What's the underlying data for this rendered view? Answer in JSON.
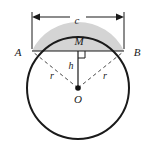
{
  "figure": {
    "name": "circular-segment-diagram",
    "type": "geometry-diagram",
    "background": "#ffffff",
    "stroke_color": "#1a1a1a",
    "segment_fill": "#d4d4d4",
    "dashed_color": "#555555"
  },
  "labels": {
    "chord_dimension": "c",
    "point_a": "A",
    "point_b": "B",
    "segment_area": "M",
    "height": "h",
    "radius_left": "r",
    "radius_right": "r",
    "center": "O"
  },
  "geometry": {
    "circle": {
      "cx": 78,
      "cy": 88,
      "r": 51
    },
    "chord": {
      "x1": 32,
      "y1": 51,
      "x2": 124,
      "y2": 51
    },
    "dimension_line": {
      "y": 17,
      "x1": 32,
      "x2": 124
    },
    "height_line": {
      "x": 78,
      "y1": 51,
      "y2": 88
    },
    "right_angle_marker": {
      "x": 78,
      "y": 51,
      "size": 7
    },
    "center_dot": {
      "cx": 78,
      "cy": 88,
      "r": 2.6
    }
  },
  "icons": {
    "arrow_left": "arrow-left-icon",
    "arrow_right": "arrow-right-icon",
    "center_dot": "center-point-dot-icon",
    "right_angle": "right-angle-marker-icon"
  }
}
